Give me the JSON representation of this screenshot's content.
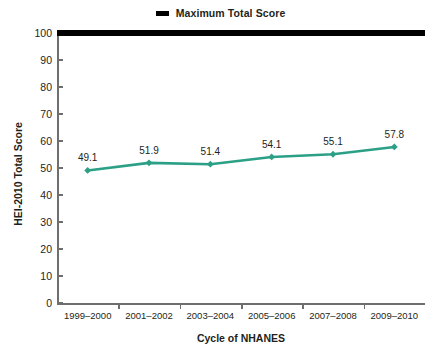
{
  "legend": {
    "position": "top-center",
    "items": [
      {
        "label": "Maximum Total Score",
        "marker": "thick-dash",
        "color": "#000000"
      }
    ]
  },
  "axes": {
    "y_title": "HEI-2010 Total Score",
    "x_title": "Cycle of NHANES"
  },
  "colors": {
    "series_line": "#2BA086",
    "max_line": "#000000",
    "axis": "#6e6e6e",
    "text": "#231f20",
    "background": "#ffffff"
  },
  "chart_data": {
    "type": "line",
    "title": "",
    "subtitle": "",
    "xlabel": "Cycle of NHANES",
    "ylabel": "HEI-2010 Total Score",
    "categories": [
      "1999–2000",
      "2001–2002",
      "2003–2004",
      "2005–2006",
      "2007–2008",
      "2009–2010"
    ],
    "series": [
      {
        "name": "HEI-2010 Total Score",
        "color": "#2BA086",
        "values": [
          49.1,
          51.9,
          51.4,
          54.1,
          55.1,
          57.8
        ],
        "labels": [
          "49.1",
          "51.9",
          "51.4",
          "54.1",
          "55.1",
          "57.8"
        ],
        "marker": "diamond",
        "show_labels": true
      },
      {
        "name": "Maximum Total Score",
        "color": "#000000",
        "values": [
          100,
          100,
          100,
          100,
          100,
          100
        ],
        "style": "thick-horizontal-line",
        "show_labels": false
      }
    ],
    "ylim": [
      0,
      100
    ],
    "ytick_step": 10,
    "yticks": [
      0,
      10,
      20,
      30,
      40,
      50,
      60,
      70,
      80,
      90,
      100
    ],
    "ytick_labels": [
      "0",
      "10",
      "20",
      "30",
      "40",
      "50",
      "60",
      "70",
      "80",
      "90",
      "100"
    ],
    "grid": false,
    "legend_position": "top-center"
  }
}
